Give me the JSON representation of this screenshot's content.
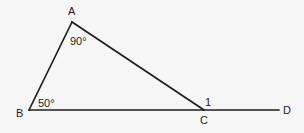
{
  "diagram": {
    "type": "geometry-triangle",
    "colors": {
      "background": "#f6f6f6",
      "stroke": "#1e1e1e"
    },
    "points": {
      "A": {
        "label": "A",
        "x": 72,
        "y": 22
      },
      "B": {
        "label": "B",
        "x": 29,
        "y": 110
      },
      "C": {
        "label": "C",
        "x": 204,
        "y": 110
      },
      "D": {
        "label": "D",
        "x": 279,
        "y": 110
      }
    },
    "segments": [
      {
        "from": "A",
        "to": "B"
      },
      {
        "from": "A",
        "to": "C"
      },
      {
        "from": "B",
        "to": "D"
      }
    ],
    "angle_labels": {
      "A": "90°",
      "B": "50°",
      "C_exterior": "1"
    }
  }
}
